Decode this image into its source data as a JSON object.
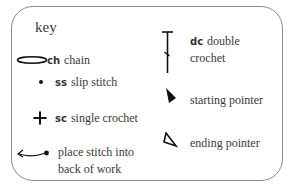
{
  "key": {
    "title": "key",
    "entries": [
      {
        "icon": "chain-oval-icon",
        "abbr": "ch",
        "label": "chain"
      },
      {
        "icon": "slip-stitch-dot-icon",
        "abbr": "ss",
        "label": "slip stitch"
      },
      {
        "icon": "single-crochet-plus-icon",
        "abbr": "sc",
        "label": "single crochet"
      },
      {
        "icon": "back-of-work-arrow-icon",
        "abbr": "",
        "label_line1": "place stitch into",
        "label_line2": "back of work"
      },
      {
        "icon": "double-crochet-icon",
        "abbr": "dc",
        "label_line1": "double",
        "label_line2": "crochet"
      },
      {
        "icon": "starting-pointer-icon",
        "abbr": "",
        "label": "starting pointer"
      },
      {
        "icon": "ending-pointer-icon",
        "abbr": "",
        "label": "ending pointer"
      }
    ]
  },
  "colors": {
    "border": "#8a8a8a",
    "text": "#3a3a3a",
    "icon": "#111111"
  }
}
